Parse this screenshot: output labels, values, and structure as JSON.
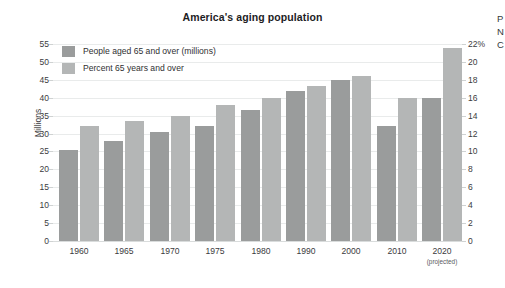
{
  "chart_data": {
    "type": "bar",
    "title": "America's aging population",
    "xlabel": "",
    "ylabel": "Millions",
    "ylabel_right": "",
    "categories": [
      "1960",
      "1965",
      "1970",
      "1975",
      "1980",
      "1990",
      "2000",
      "2010",
      "2020"
    ],
    "category_notes": [
      "",
      "",
      "",
      "",
      "",
      "",
      "",
      "",
      "(projected)"
    ],
    "grid": true,
    "legend_position": "top-left",
    "ylim": [
      0,
      55
    ],
    "yticks": [
      "55",
      "50",
      "45",
      "40",
      "35",
      "30",
      "25",
      "20",
      "15",
      "10",
      "5",
      "0"
    ],
    "ylim_right": [
      0,
      22
    ],
    "yticks_right": [
      "22%",
      "20",
      "18",
      "16",
      "14",
      "12",
      "10",
      "8",
      "6",
      "4",
      "2",
      "0"
    ],
    "series": [
      {
        "name": "People aged 65 and over (millions)",
        "axis": "left",
        "color": "#9a9c9c",
        "values": [
          25.5,
          27.8,
          30.5,
          32.2,
          36.5,
          41.8,
          45.0,
          32.0,
          40.0
        ]
      },
      {
        "name": "Percent 65 years and over",
        "axis": "right",
        "color": "#b4b6b6",
        "values": [
          12.8,
          13.4,
          14.0,
          15.2,
          16.0,
          17.3,
          18.4,
          16.0,
          21.6
        ]
      }
    ]
  },
  "legend": {
    "items": [
      {
        "label": "People aged 65 and over (millions)",
        "color": "#9a9c9c"
      },
      {
        "label": "Percent 65 years and over",
        "color": "#b4b6b6"
      }
    ]
  },
  "edge_caption": {
    "line1": "P",
    "line2": "N",
    "line3": "C"
  }
}
